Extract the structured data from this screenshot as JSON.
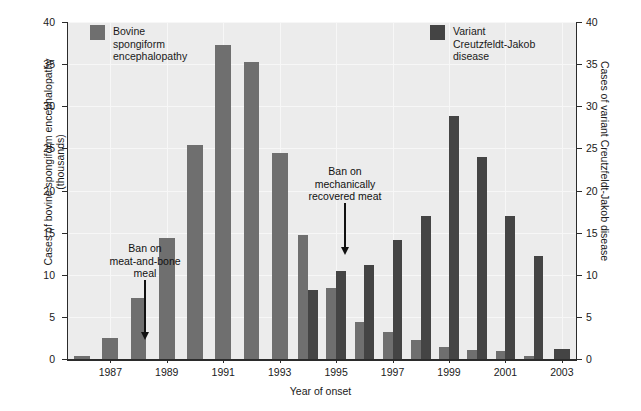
{
  "chart_data": {
    "type": "bar",
    "title": "",
    "xlabel": "Year of onset",
    "ylabel": "Cases of bovine spongiform encephalopathy (thousands)",
    "ylabel_right": "Cases of variant Creutzfeldt-Jakob disease",
    "ylim": [
      0,
      40
    ],
    "ylim_right": [
      0,
      40
    ],
    "yticks": [
      0,
      5,
      10,
      15,
      20,
      25,
      30,
      35,
      40
    ],
    "yticks_right": [
      0,
      5,
      10,
      15,
      20,
      25,
      30,
      35,
      40
    ],
    "grid": true,
    "legend_position": "inside-top",
    "categories": [
      1986,
      1987,
      1988,
      1989,
      1990,
      1991,
      1992,
      1993,
      1994,
      1995,
      1996,
      1997,
      1998,
      1999,
      2000,
      2001,
      2002,
      2003
    ],
    "xtick_labels": [
      "1987",
      "1989",
      "1991",
      "1993",
      "1995",
      "1997",
      "1999",
      "2001",
      "2003"
    ],
    "xtick_values": [
      1987,
      1989,
      1991,
      1993,
      1995,
      1997,
      1999,
      2001,
      2003
    ],
    "series": [
      {
        "name": "Bovine spongiform encephalopathy",
        "axis": "left",
        "unit": "thousands",
        "color": "#6f6f6f",
        "values": [
          0.4,
          2.5,
          7.2,
          14.4,
          25.4,
          37.3,
          35.2,
          24.5,
          14.7,
          8.4,
          4.4,
          3.2,
          2.2,
          1.4,
          1.1,
          1.0,
          0.3,
          0.0
        ]
      },
      {
        "name": "Variant Creutzfeldt-Jakob disease",
        "axis": "right",
        "unit": "cases",
        "color": "#444444",
        "values": [
          0,
          0,
          0,
          0,
          0,
          0,
          0,
          0,
          8.2,
          10.5,
          11.2,
          14.1,
          17.0,
          28.8,
          24.0,
          17.0,
          12.2,
          1.2
        ]
      }
    ],
    "annotations": [
      {
        "id": "ban-meat-and-bone-meal",
        "text": "Ban on\nmeat-and-bone\nmeal",
        "arrow": "down",
        "points_to_year": 1987
      },
      {
        "id": "ban-mechanically-recovered-meat",
        "text": "Ban on\nmechanically\nrecovered meat",
        "arrow": "down",
        "points_to_year": 1995
      }
    ]
  },
  "legend": {
    "bse": {
      "label": "Bovine\nspongiform\nencephalopathy",
      "color": "#6f6f6f"
    },
    "vcjd": {
      "label": "Variant\nCreutzfeldt-Jakob\ndisease",
      "color": "#444444"
    }
  },
  "axes": {
    "left_title": "Cases of bovine spongiform encephalopathy\n(thousands)",
    "right_title": "Cases of variant Creutzfeldt-Jakob disease",
    "bottom_title": "Year of onset"
  },
  "annotations": {
    "mbm": "Ban on\nmeat-and-bone\nmeal",
    "mrm": "Ban on\nmechanically\nrecovered meat"
  },
  "colors": {
    "plot_background": "#ececec",
    "grid": "#f7f7f7",
    "axis": "#2b2b2b",
    "bse_bar": "#6f6f6f",
    "vcjd_bar": "#444444",
    "page_background": "#ffffff"
  }
}
